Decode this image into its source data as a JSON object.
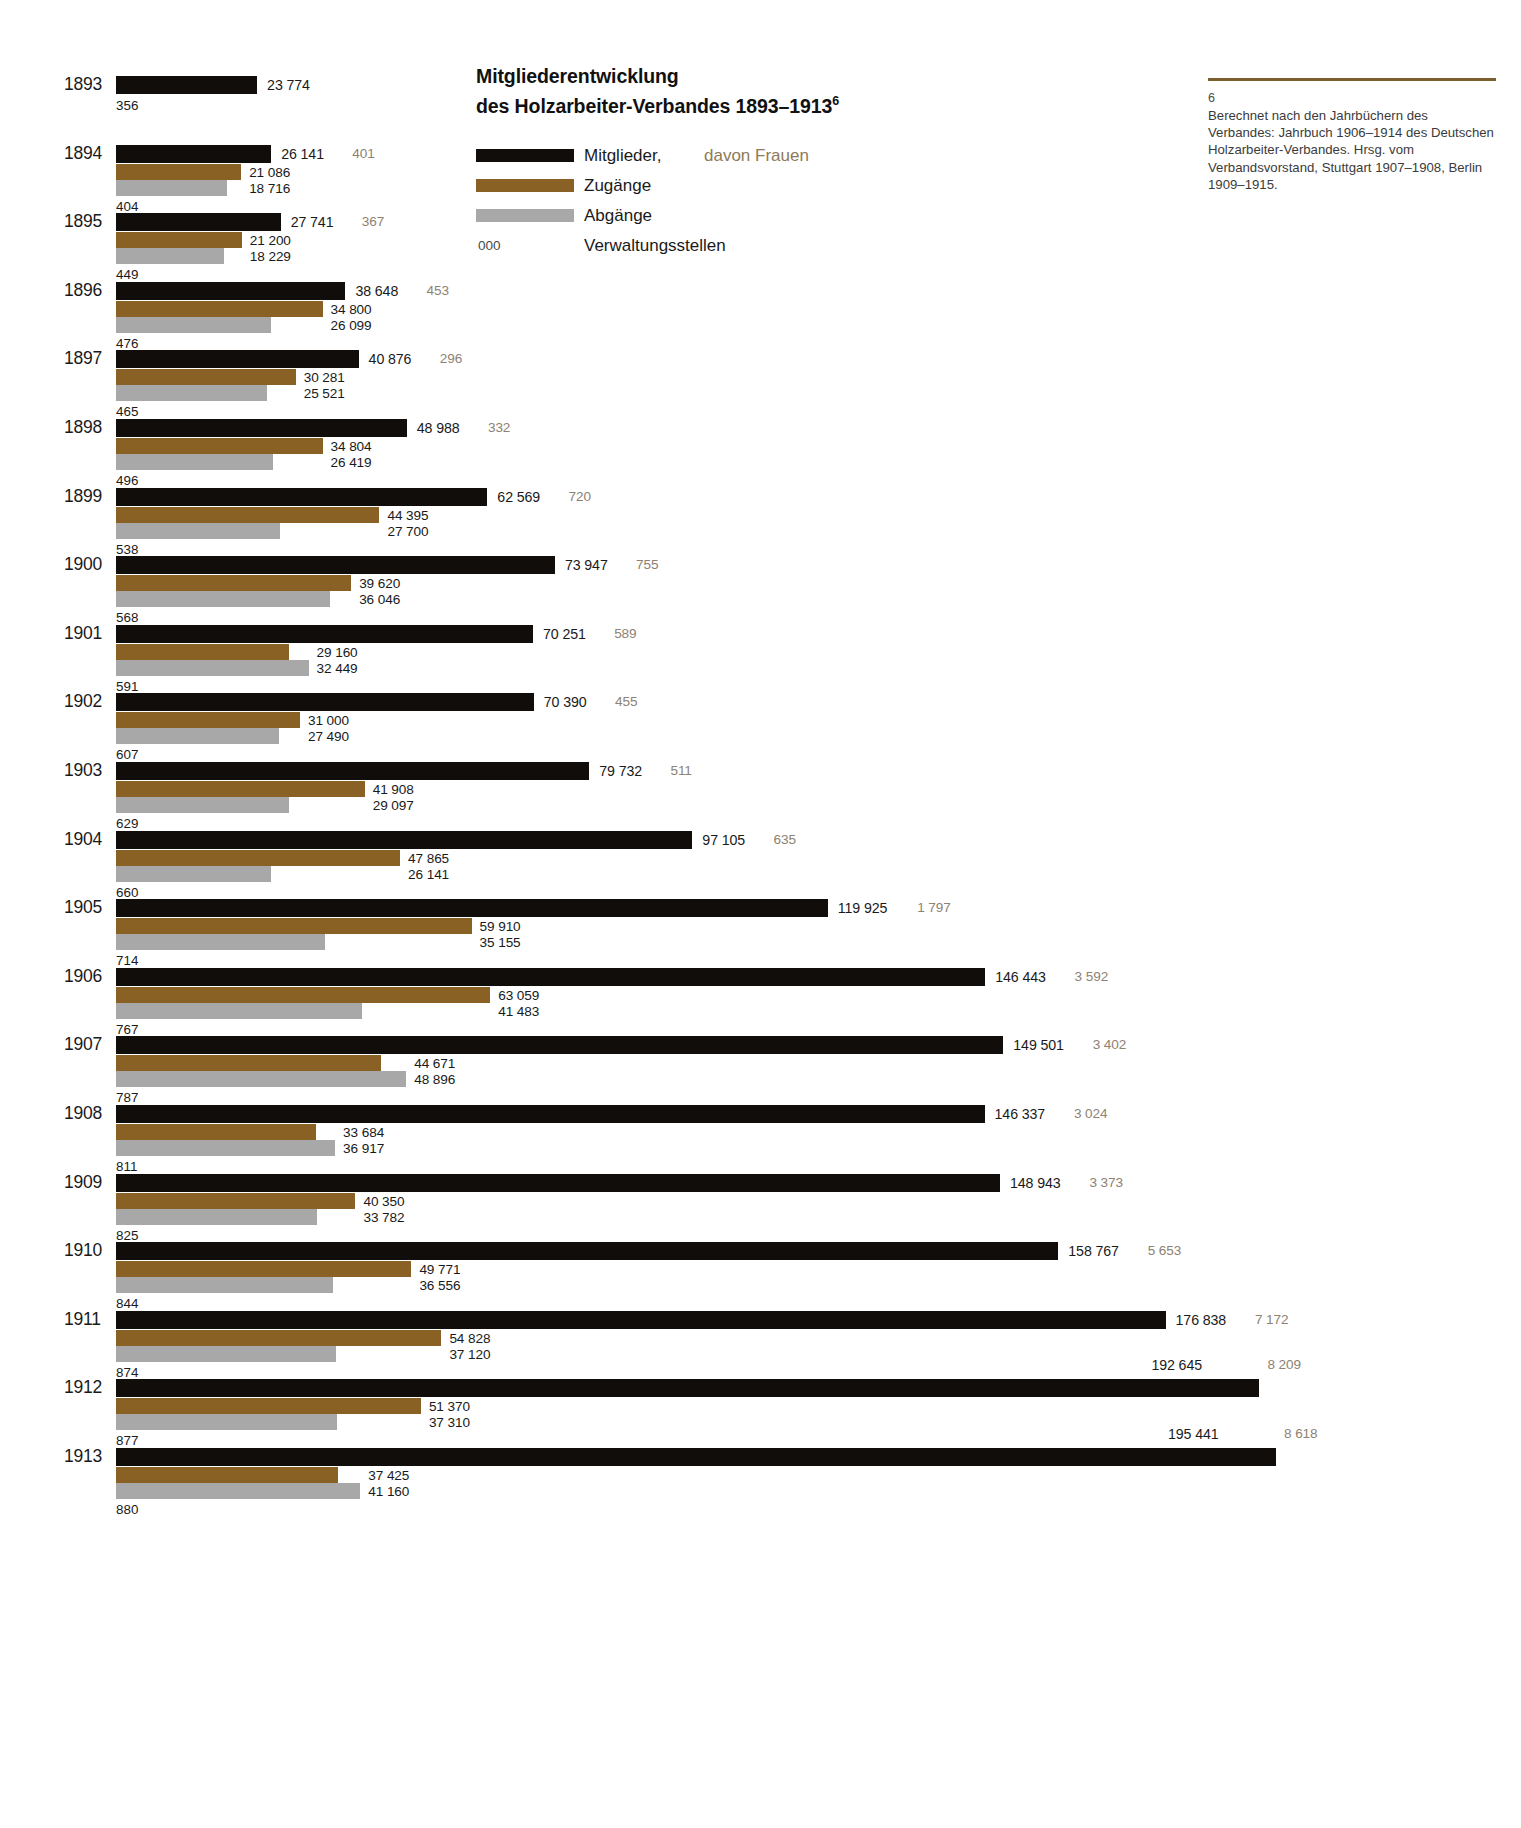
{
  "title": {
    "line1": "Mitgliederentwicklung",
    "line2": "des Holzarbeiter-Verbandes 1893–1913",
    "footnote_marker": "6"
  },
  "legend": {
    "members_label": "Mitglieder,",
    "women_label": "davon Frauen",
    "zugaenge_label": "Zugänge",
    "abgaenge_label": "Abgänge",
    "admin_sample": "000",
    "admin_label": "Verwaltungsstellen"
  },
  "footnote": {
    "number": "6",
    "text": "Berechnet nach den Jahrbüchern des Verbandes: Jahrbuch 1906–1914 des Deutschen Holzarbeiter-Verbandes. Hrsg. vom Verbandsvorstand, Stuttgart 1907–1908, Berlin 1909–1915."
  },
  "colors": {
    "members": "#100d0a",
    "zugaenge": "#8a6124",
    "abgaenge": "#a8a8a8",
    "women_text": "#8e8273",
    "rule": "#7b5f2e"
  },
  "chart_data": {
    "type": "bar",
    "title": "Mitgliederentwicklung des Holzarbeiter-Verbandes 1893–1913",
    "xlabel": "",
    "ylabel": "",
    "orientation": "horizontal",
    "grid": false,
    "legend_position": "top-center",
    "categories": [
      "1893",
      "1894",
      "1895",
      "1896",
      "1897",
      "1898",
      "1899",
      "1900",
      "1901",
      "1902",
      "1903",
      "1904",
      "1905",
      "1906",
      "1907",
      "1908",
      "1909",
      "1910",
      "1911",
      "1912",
      "1913"
    ],
    "series": [
      {
        "name": "Mitglieder",
        "color": "#100d0a",
        "values": [
          23774,
          26141,
          27741,
          38648,
          40876,
          48988,
          62569,
          73947,
          70251,
          70390,
          79732,
          97105,
          119925,
          146443,
          149501,
          146337,
          148943,
          158767,
          176838,
          192645,
          195441
        ],
        "labels": [
          "23 774",
          "26 141",
          "27 741",
          "38 648",
          "40 876",
          "48 988",
          "62 569",
          "73 947",
          "70 251",
          "70 390",
          "79 732",
          "97 105",
          "119 925",
          "146 443",
          "149 501",
          "146 337",
          "148 943",
          "158 767",
          "176 838",
          "192 645",
          "195 441"
        ]
      },
      {
        "name": "Zugänge",
        "color": "#8a6124",
        "values": [
          null,
          21086,
          21200,
          34800,
          30281,
          34804,
          44395,
          39620,
          29160,
          31000,
          41908,
          47865,
          59910,
          63059,
          44671,
          33684,
          40350,
          49771,
          54828,
          51370,
          37425
        ],
        "labels": [
          "",
          "21 086",
          "21 200",
          "34 800",
          "30 281",
          "34 804",
          "44 395",
          "39 620",
          "29 160",
          "31 000",
          "41 908",
          "47 865",
          "59 910",
          "63 059",
          "44 671",
          "33 684",
          "40 350",
          "49 771",
          "54 828",
          "51 370",
          "37 425"
        ]
      },
      {
        "name": "Abgänge",
        "color": "#a8a8a8",
        "values": [
          null,
          18716,
          18229,
          26099,
          25521,
          26419,
          27700,
          36046,
          32449,
          27490,
          29097,
          26141,
          35155,
          41483,
          48896,
          36917,
          33782,
          36556,
          37120,
          37310,
          41160
        ],
        "labels": [
          "",
          "18 716",
          "18 229",
          "26 099",
          "25 521",
          "26 419",
          "27 700",
          "36 046",
          "32 449",
          "27 490",
          "29 097",
          "26 141",
          "35 155",
          "41 483",
          "48 896",
          "36 917",
          "33 782",
          "36 556",
          "37 120",
          "37 310",
          "41 160"
        ]
      },
      {
        "name": "davon Frauen",
        "color": "#8e8273",
        "values": [
          null,
          401,
          367,
          453,
          296,
          332,
          720,
          755,
          589,
          455,
          511,
          635,
          1797,
          3592,
          3402,
          3024,
          3373,
          5653,
          7172,
          8209,
          8618
        ],
        "labels": [
          "",
          "401",
          "367",
          "453",
          "296",
          "332",
          "720",
          "755",
          "589",
          "455",
          "511",
          "635",
          "1 797",
          "3 592",
          "3 402",
          "3 024",
          "3 373",
          "5 653",
          "7 172",
          "8 209",
          "8 618"
        ]
      },
      {
        "name": "Verwaltungsstellen",
        "color": "#1a1a1a",
        "values": [
          356,
          404,
          449,
          476,
          465,
          496,
          538,
          568,
          591,
          607,
          629,
          660,
          714,
          767,
          787,
          811,
          825,
          844,
          874,
          877,
          880
        ],
        "labels": [
          "356",
          "404",
          "449",
          "476",
          "465",
          "496",
          "538",
          "568",
          "591",
          "607",
          "629",
          "660",
          "714",
          "767",
          "787",
          "811",
          "825",
          "844",
          "874",
          "877",
          "880"
        ]
      }
    ]
  }
}
